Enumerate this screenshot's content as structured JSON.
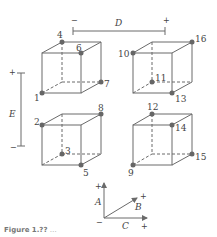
{
  "figure": {
    "axes": {
      "D": {
        "label": "D",
        "minus": "−",
        "plus": "+"
      },
      "E": {
        "label": "E",
        "minus": "−",
        "plus": "+"
      },
      "legend": {
        "A": "A",
        "B": "B",
        "C": "C",
        "minus": "−",
        "plus_a": "+",
        "plus_b": "+",
        "plus_c": "+"
      }
    },
    "vertices": {
      "v1": "1",
      "v2": "2",
      "v3": "3",
      "v4": "4",
      "v5": "5",
      "v6": "6",
      "v7": "7",
      "v8": "8",
      "v9": "9",
      "v10": "10",
      "v11": "11",
      "v12": "12",
      "v13": "13",
      "v14": "14",
      "v15": "15",
      "v16": "16"
    },
    "caption": {
      "prefix": "Figure 1.??",
      "text": "…"
    }
  }
}
